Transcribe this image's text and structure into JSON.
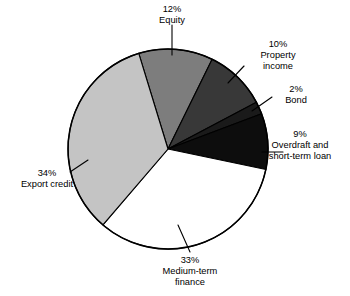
{
  "chart_data": {
    "type": "pie",
    "title": "",
    "xlabel": "",
    "ylabel": "",
    "legend_position": "none",
    "grid": false,
    "units": "percent",
    "total": 100,
    "start_angle_deg": -17,
    "direction": "clockwise",
    "categories": [
      "Equity",
      "Property income",
      "Bond",
      "Overdraft and short-term loan",
      "Medium-term finance",
      "Export credit"
    ],
    "values": [
      12,
      10,
      2,
      9,
      33,
      34
    ],
    "slices": [
      {
        "name": "Equity",
        "value": 12,
        "percent_label": "12%",
        "label_lines": [
          "Equity"
        ],
        "color": "#7d7d7d"
      },
      {
        "name": "Property income",
        "value": 10,
        "percent_label": "10%",
        "label_lines": [
          "Property",
          "income"
        ],
        "color": "#383838"
      },
      {
        "name": "Bond",
        "value": 2,
        "percent_label": "2%",
        "label_lines": [
          "Bond"
        ],
        "color": "#1a1a1a"
      },
      {
        "name": "Overdraft and short-term loan",
        "value": 9,
        "percent_label": "9%",
        "label_lines": [
          "Overdraft and",
          "short-term loan"
        ],
        "color": "#0d0d0d"
      },
      {
        "name": "Medium-term finance",
        "value": 33,
        "percent_label": "33%",
        "label_lines": [
          "Medium-term",
          "finance"
        ],
        "color": "#ffffff"
      },
      {
        "name": "Export credit",
        "value": 34,
        "percent_label": "34%",
        "label_lines": [
          "Export credit"
        ],
        "color": "#c4c4c4"
      }
    ]
  },
  "labels": {
    "equity": {
      "pct": "12%",
      "line1": "Equity"
    },
    "property_income": {
      "pct": "10%",
      "line1": "Property",
      "line2": "income"
    },
    "bond": {
      "pct": "2%",
      "line1": "Bond"
    },
    "overdraft": {
      "pct": "9%",
      "line1": "Overdraft and",
      "line2": "short-term loan"
    },
    "medium_term": {
      "pct": "33%",
      "line1": "Medium-term",
      "line2": "finance"
    },
    "export_credit": {
      "pct": "34%",
      "line1": "Export credit"
    }
  },
  "colors": {
    "equity": "#7d7d7d",
    "property_income": "#383838",
    "bond": "#1a1a1a",
    "overdraft": "#0d0d0d",
    "medium_term": "#ffffff",
    "export_credit": "#c4c4c4",
    "outline": "#000000",
    "background": "#ffffff"
  }
}
